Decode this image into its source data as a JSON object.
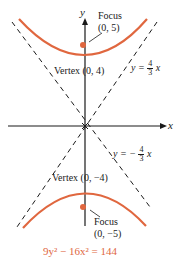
{
  "diagram": {
    "title_equation": "9y² − 16x² = 144",
    "axes": {
      "x_label": "x",
      "y_label": "y"
    },
    "asymptotes": [
      {
        "label_prefix": "y =",
        "numerator": "4",
        "denominator": "3",
        "var": "x"
      },
      {
        "label_prefix": "y = −",
        "numerator": "4",
        "denominator": "3",
        "var": "x"
      }
    ],
    "focus_top": {
      "label": "Focus",
      "coords": "(0, 5)"
    },
    "focus_bottom": {
      "label": "Focus",
      "coords": "(0, −5)"
    },
    "vertex_top": {
      "label": "Vertex",
      "coords": "(0, 4)"
    },
    "vertex_bottom": {
      "label": "Vertex",
      "coords": "(0, −4)"
    },
    "colors": {
      "curve": "#e0673f",
      "axis": "#1a1a1a",
      "equation": "#e0673f"
    }
  }
}
